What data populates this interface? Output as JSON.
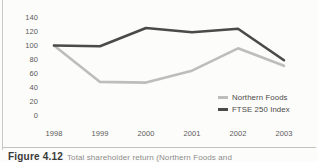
{
  "figure": {
    "caption_number": "Figure 4.12",
    "caption_text": "Total shareholder return (Northern Foods and"
  },
  "chart_data": {
    "type": "line",
    "title": "",
    "xlabel": "",
    "ylabel": "",
    "categories": [
      "1998",
      "1999",
      "2000",
      "2001",
      "2002",
      "2003"
    ],
    "x": [
      1998,
      1999,
      2000,
      2001,
      2002,
      2003
    ],
    "series": [
      {
        "name": "Northern Foods",
        "color": "#bdbdbd",
        "values": [
          100,
          48,
          47,
          64,
          96,
          71
        ]
      },
      {
        "name": "FTSE 250 Index",
        "color": "#4a4a4a",
        "values": [
          100,
          99,
          125,
          119,
          124,
          79
        ]
      }
    ],
    "ylim": [
      0,
      140
    ],
    "yticks": [
      140,
      120,
      100,
      80,
      60,
      40,
      20,
      0
    ],
    "grid": false,
    "legend_position": "inside-bottom-right"
  },
  "colors": {
    "background": "#fcfcfb",
    "axis_text": "#5a5a58",
    "northern_foods": "#bdbdbd",
    "ftse_250": "#4a4a4a",
    "divider": "#c2c2be"
  }
}
